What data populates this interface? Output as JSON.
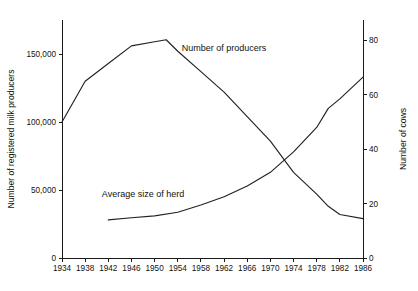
{
  "chart_data": {
    "type": "line",
    "title": "",
    "xlabel": "",
    "ylabel": "Number of registered milk producers",
    "y2label": "Number of cows",
    "xlim": [
      1934,
      1986
    ],
    "ylim": [
      0,
      175000
    ],
    "y2lim": [
      0,
      87.5
    ],
    "grid": false,
    "legend_position": "inline-annotations",
    "x_ticks": [
      1934,
      1938,
      1942,
      1946,
      1950,
      1954,
      1958,
      1962,
      1966,
      1970,
      1974,
      1978,
      1982,
      1986
    ],
    "x_tick_labels": [
      "1934",
      "1938",
      "1942",
      "1946",
      "1950",
      "1954",
      "1958",
      "1962",
      "1966",
      "1970",
      "1974",
      "1978",
      "1982",
      "1986"
    ],
    "y_ticks": [
      0,
      50000,
      100000,
      150000
    ],
    "y_tick_labels": [
      "0",
      "50,000",
      "100,000",
      "150,000"
    ],
    "y2_ticks": [
      0,
      20,
      40,
      60,
      80
    ],
    "y2_tick_labels": [
      "0",
      "20",
      "40",
      "60",
      "80"
    ],
    "series": [
      {
        "name": "Number of producers",
        "axis": "left",
        "label_x": 1962,
        "label_y": 152000,
        "x": [
          1934,
          1938,
          1942,
          1946,
          1950,
          1952,
          1954,
          1958,
          1962,
          1966,
          1970,
          1974,
          1978,
          1980,
          1982,
          1986
        ],
        "values": [
          100000,
          130000,
          143000,
          156000,
          159000,
          160500,
          152000,
          137000,
          122000,
          104000,
          86000,
          63000,
          47000,
          38000,
          32000,
          29000
        ]
      },
      {
        "name": "Average size of herd",
        "axis": "right",
        "label_x": 1948,
        "label_y": 22.5,
        "x": [
          1942,
          1946,
          1950,
          1954,
          1958,
          1962,
          1966,
          1970,
          1974,
          1978,
          1980,
          1982,
          1986
        ],
        "values": [
          14.0,
          14.8,
          15.5,
          16.8,
          19.5,
          22.5,
          26.5,
          31.5,
          39.0,
          48.0,
          55.0,
          58.5,
          66.5
        ]
      }
    ]
  },
  "axes": {
    "left_title": "Number of registered milk producers",
    "right_title": "Number of cows"
  },
  "annotations": {
    "producers_label": "Number of producers",
    "herd_label": "Average size of herd"
  }
}
